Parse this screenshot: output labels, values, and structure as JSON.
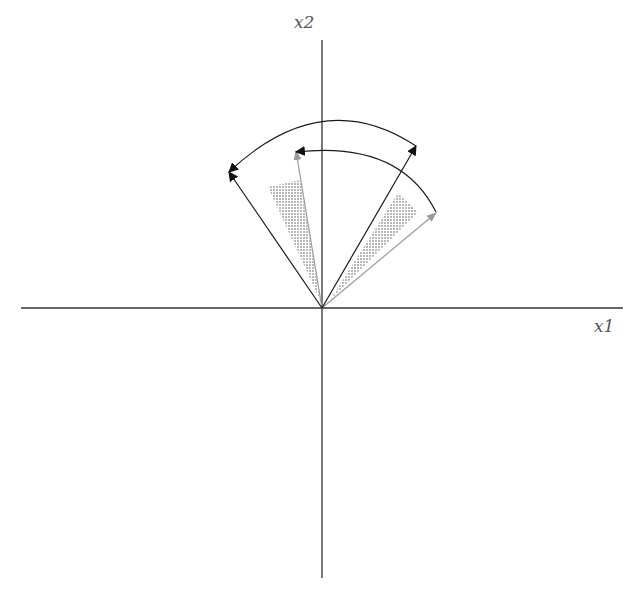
{
  "diagram": {
    "type": "vector-rotation",
    "axes": {
      "x_label": "x1",
      "y_label": "x2",
      "origin": [
        322,
        308
      ],
      "x_range_px": [
        21,
        623
      ],
      "y_range_px": [
        40,
        578
      ]
    },
    "vectors": [
      {
        "name": "black-left",
        "color": "#1a1a1a",
        "tip": [
          229,
          172
        ]
      },
      {
        "name": "black-right",
        "color": "#1a1a1a",
        "tip": [
          416,
          146
        ]
      },
      {
        "name": "gray-left",
        "color": "#9a9a9a",
        "tip": [
          296,
          150
        ]
      },
      {
        "name": "gray-right",
        "color": "#9a9a9a",
        "tip": [
          436,
          212
        ]
      }
    ],
    "arcs": [
      {
        "name": "outer-arc",
        "from": [
          416,
          146
        ],
        "to": [
          229,
          172
        ],
        "control": [
          322,
          84
        ]
      },
      {
        "name": "inner-arc",
        "from": [
          436,
          212
        ],
        "to": [
          296,
          152
        ],
        "control": [
          380,
          140
        ]
      }
    ],
    "shaded_regions": [
      {
        "name": "left-shade",
        "points": [
          [
            268,
            187
          ],
          [
            300,
            180
          ],
          [
            320,
            300
          ]
        ]
      },
      {
        "name": "right-shade",
        "points": [
          [
            398,
            193
          ],
          [
            418,
            212
          ],
          [
            330,
            300
          ]
        ]
      }
    ],
    "colors": {
      "axis": "#333333",
      "black_vector": "#1a1a1a",
      "gray_vector": "#9a9a9a",
      "shade": "#bdbdbd"
    }
  }
}
